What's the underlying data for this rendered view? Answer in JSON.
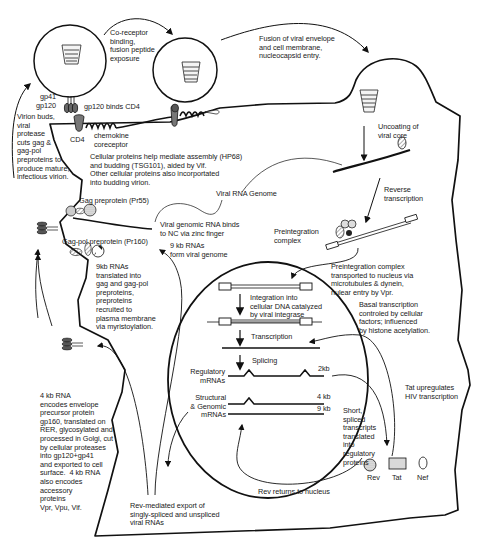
{
  "diagram": {
    "type": "biological-lifecycle",
    "stages": [
      "Binding (gp120 binds CD4)",
      "Co-receptor binding, fusion peptide exposure",
      "Fusion of viral envelope and cell membrane, nucleocapsid entry",
      "Uncoating of viral core",
      "Reverse transcription",
      "Preintegration complex transported to nucleus",
      "Integration into cellular DNA",
      "Transcription",
      "Splicing",
      "Rev-mediated export",
      "Translation",
      "Assembly and budding",
      "Maturation"
    ]
  },
  "labels": {
    "coreceptor_binding": "Co-receptor\nbinding,\nfusion peptide\nexposure",
    "fusion": "Fusion of viral envelope\nand cell membrane,\nnucleocapsid entry.",
    "gp41": "gp41",
    "gp120": "gp120",
    "gp120_binds": "gp120 binds CD4",
    "cd4": "CD4",
    "chemokine": "chemokine\ncoreceptor",
    "virion_buds": "Virion buds,\nviral\nprotease\ncuts gag &\ngag-pol\npreproteins to\nproduce mature,\ninfectious virion.",
    "uncoating": "Uncoating of\nviral core",
    "cellular_proteins": "Cellular proteins help mediate assembly (HP68)\nand budding (TSG101), aided by Vif.\nOther cellular proteins also incorportated\ninto budding virion.",
    "viral_rna_genome": "Viral RNA Genome",
    "reverse_transcription": "Reverse\ntranscription",
    "gag_preprotein": "Gag preprotein (Pr55)",
    "viral_genomic_rna_binds": "Viral genomic RNA binds\nto NC via zinc finger",
    "preintegration_complex": "Preintegration\ncomplex",
    "gagpol_preprotein": "Gag-pol preprotein (Pr160)",
    "nine_kb_form": "9 kb RNAs\nform viral genome",
    "nine_kb_translated": "9kb RNAs\ntranslated into\ngag and gag-pol\npreproteins,\npreproteins\nrecruited to\nplasma membrane\nvia myristoylation.",
    "pic_transported": "Preintegration complex\ntransported to nucleus via\nmicrotubules & dynein,\nnulear entry by Vpr.",
    "integration": "Integration into\ncellular DNA catalyzed\nby viral integrase",
    "basal_transcription": "Basal transcription\ncontroled by cellular\nfactors; influenced\nby histone acetylation.",
    "transcription": "Transcription",
    "splicing": "Splicing",
    "regulatory_mrnas": "Regulatory\nmRNAs",
    "two_kb": "2kb",
    "structural_mrnas": "Structural\n& Genomic\nmRNAs",
    "four_kb": "4 kb",
    "nine_kb": "9 kb",
    "tat_upregulates": "Tat upregulates\nHIV transcription",
    "short_spliced": "Short,\nspliced\ntranscripts\ntranslated\ninto\nregulatory\nproteins",
    "four_kb_rna": "4 kb RNA\nencodes envelope\nprecursor protein\ngp160, translated on\nRER, glycosylated and\nprocessed in Golgi, cut\nby cellular proteases\ninto gp120+gp41\nand exported to cell\nsurface.  4 kb RNA\nalso encodes\naccessory\nproteins\nVpr, Vpu, Vif.",
    "rev_export": "Rev-mediated export of\nsingly-spliced and unspliced\nviral RNAs",
    "rev": "Rev",
    "tat": "Tat",
    "nef": "Nef",
    "rev_returns": "Rev returns to nucleus"
  },
  "colors": {
    "stroke": "#111111",
    "text": "#1a1a1a",
    "protein_fill": "#8a8a8a",
    "tat_fill": "#d9d9d9",
    "background": "#ffffff"
  }
}
